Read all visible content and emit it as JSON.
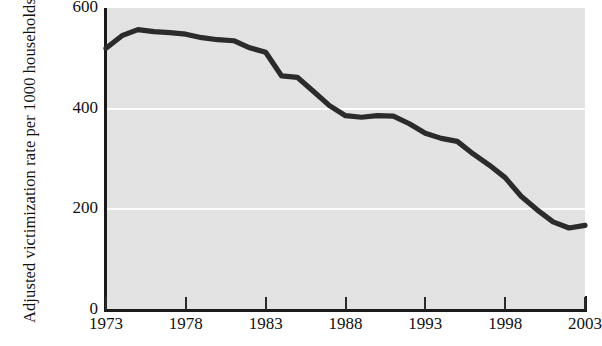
{
  "chart_data": {
    "type": "line",
    "title": "",
    "subtitle": "",
    "xlabel": "",
    "ylabel": "Adjusted victimization rate per 1000 households",
    "ylabel_line1": "Adjusted victimization rate",
    "ylabel_line2": "per 1000 households",
    "xlim": [
      1973,
      2003
    ],
    "ylim": [
      0,
      600
    ],
    "grid": true,
    "grid_lines": [
      200,
      400
    ],
    "legend": "none",
    "series_color": "#2b2b2b",
    "plot_background": "#e4e4e4",
    "x": [
      1973,
      1974,
      1975,
      1976,
      1977,
      1978,
      1979,
      1980,
      1981,
      1982,
      1983,
      1984,
      1985,
      1986,
      1987,
      1988,
      1989,
      1990,
      1991,
      1992,
      1993,
      1994,
      1995,
      1996,
      1997,
      1998,
      1999,
      2000,
      2001,
      2002,
      2003
    ],
    "values": [
      520,
      545,
      557,
      553,
      551,
      548,
      541,
      537,
      535,
      521,
      512,
      465,
      462,
      434,
      406,
      386,
      383,
      386,
      385,
      370,
      351,
      341,
      335,
      310,
      288,
      263,
      226,
      199,
      175,
      163,
      168
    ],
    "ytick_labels": [
      "0",
      "200",
      "400",
      "600"
    ],
    "ytick_values": [
      0,
      200,
      400,
      600
    ],
    "xtick_labels": [
      "1973",
      "1978",
      "1983",
      "1988",
      "1993",
      "1998",
      "2003"
    ],
    "xtick_values": [
      1973,
      1978,
      1983,
      1988,
      1993,
      1998,
      2003
    ]
  }
}
